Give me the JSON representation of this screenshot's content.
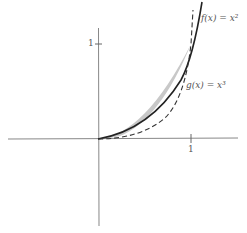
{
  "figure": {
    "curves": [
      {
        "name": "f",
        "label": "f(x) = x²",
        "style": "solid",
        "expr": "x^2"
      },
      {
        "name": "g",
        "label": "g(x) = x³",
        "style": "dashed",
        "expr": "x^3"
      }
    ],
    "shaded_region": "between f(x)=x² and g(x)=x³ for 0 ≤ x ≤ 1",
    "ticks": {
      "x": "1",
      "y": "1"
    },
    "colors": {
      "axis": "#888888",
      "curve": "#222222",
      "fill": "#c8c8c8"
    }
  }
}
